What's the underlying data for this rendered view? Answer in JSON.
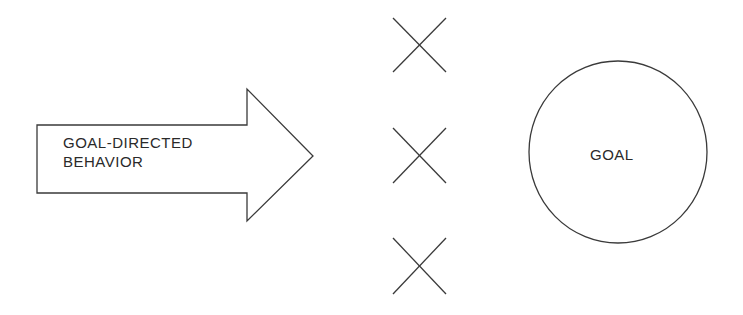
{
  "diagram": {
    "arrow": {
      "line1": "GOAL-DIRECTED",
      "line2": "BEHAVIOR"
    },
    "barriers": [
      {
        "icon": "x-mark-icon",
        "cx": 419,
        "cy": 45
      },
      {
        "icon": "x-mark-icon",
        "cx": 419,
        "cy": 155
      },
      {
        "icon": "x-mark-icon",
        "cx": 419,
        "cy": 266
      }
    ],
    "goal": {
      "label": "GOAL"
    },
    "colors": {
      "stroke": "#3a3a3a",
      "background": "#ffffff"
    }
  }
}
